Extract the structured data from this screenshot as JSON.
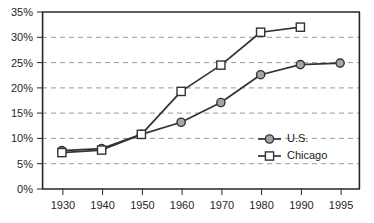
{
  "chart_data": {
    "type": "line",
    "title": "",
    "xlabel": "",
    "ylabel": "",
    "categories": [
      "1930",
      "1940",
      "1950",
      "1960",
      "1970",
      "1980",
      "1990",
      "1995"
    ],
    "ylim": [
      0,
      35
    ],
    "ytick_labels": [
      "0%",
      "5%",
      "10%",
      "15%",
      "20%",
      "25%",
      "30%",
      "35%"
    ],
    "ytick_values": [
      0,
      5,
      10,
      15,
      20,
      25,
      30,
      35
    ],
    "grid": true,
    "grid_style": "dashed-horizontal",
    "legend_position": "inside-right-middle",
    "series": [
      {
        "name": "U.S.",
        "marker": "filled-circle",
        "color": "#333333",
        "marker_fill": "#a6a6a6",
        "x": [
          "1930",
          "1940",
          "1950",
          "1960",
          "1970",
          "1980",
          "1990",
          "1995"
        ],
        "values": [
          7.6,
          8.0,
          10.8,
          13.2,
          17.1,
          22.6,
          24.6,
          24.9
        ]
      },
      {
        "name": "Chicago",
        "marker": "open-square",
        "color": "#333333",
        "marker_fill": "#ffffff",
        "x": [
          "1930",
          "1940",
          "1950",
          "1960",
          "1970",
          "1980",
          "1990"
        ],
        "values": [
          7.2,
          7.7,
          10.8,
          19.3,
          24.5,
          31.0,
          32.0
        ]
      }
    ]
  },
  "legend": {
    "entries": [
      {
        "label": "U.S."
      },
      {
        "label": "Chicago"
      }
    ]
  },
  "axis": {
    "y_labels": [
      "35%",
      "30%",
      "25%",
      "20%",
      "15%",
      "10%",
      "5%",
      "0%"
    ],
    "x_labels": [
      "1930",
      "1940",
      "1950",
      "1960",
      "1970",
      "1980",
      "1990",
      "1995"
    ]
  }
}
